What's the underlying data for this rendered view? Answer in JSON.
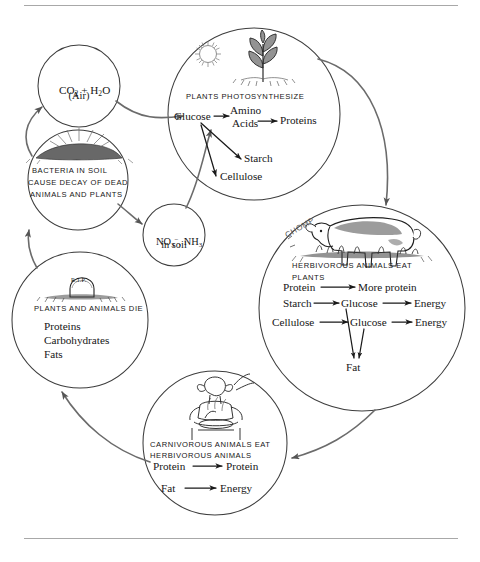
{
  "figure": {
    "domain_label": "carbon-nitrogen-cycle-diagram",
    "background_color": "#ffffff",
    "line_color": "#4a4a4a",
    "text_color": "#161616",
    "rule_color": "#a8a8a8"
  },
  "nodes": {
    "air": {
      "id": "air-circle",
      "line1_pre": "CO",
      "line1_sub": "2",
      "line1_mid": " + H",
      "line1_sub2": "2",
      "line1_post": "O",
      "line2": "(Air)",
      "cx": 79,
      "cy": 86,
      "r": 41
    },
    "bacteria": {
      "id": "bacteria-circle",
      "caption_line1": "BACTERIA IN SOIL",
      "caption_line2": "CAUSE DECAY OF DEAD",
      "caption_line3": "ANIMALS AND PLANTS",
      "icon": "soil-mound-icon",
      "cx": 78,
      "cy": 180,
      "r": 50
    },
    "soil_nutrients": {
      "id": "soil-nutrients-circle",
      "line1_pre": "NO",
      "line1_sub": "3",
      "line1_sup": "−",
      "line1_post": ", NH",
      "line1_sub2": "3",
      "line2": "in soil",
      "cx": 174,
      "cy": 235,
      "r": 31
    },
    "plants": {
      "id": "plants-photosynthesize-circle",
      "caption": "PLANTS PHOTOSYNTHESIZE",
      "icons": [
        "sun-icon",
        "plant-seedling-icon"
      ],
      "cx": 254,
      "cy": 114,
      "r": 86,
      "reactions": {
        "glucose": "Glucose",
        "amino_line1": "Amino",
        "amino_line2": "Acids",
        "proteins": "Proteins",
        "starch": "Starch",
        "cellulose": "Cellulose"
      }
    },
    "herbivores": {
      "id": "herbivorous-animals-circle",
      "caption_line1": "HERBIVOROUS ANIMALS EAT",
      "caption_line2": "PLANTS",
      "icon": "grazing-cow-icon",
      "sound_effect": "CHOMP",
      "cx": 362,
      "cy": 308,
      "r": 103,
      "reactions": {
        "protein": "Protein",
        "more_protein": "More protein",
        "starch": "Starch",
        "glucose_1": "Glucose",
        "energy_1": "Energy",
        "cellulose": "Cellulose",
        "glucose_2": "Glucose",
        "energy_2": "Energy",
        "fat": "Fat"
      }
    },
    "death": {
      "id": "plants-animals-die-circle",
      "caption": "PLANTS AND ANIMALS DIE",
      "icon": "gravestone-rip-icon",
      "icon_text": "R.I.P.",
      "cx": 80,
      "cy": 320,
      "r": 68,
      "items": [
        "Proteins",
        "Carbohydrates",
        "Fats"
      ]
    },
    "carnivores": {
      "id": "carnivorous-animals-circle",
      "caption_line1": "CARNIVOROUS ANIMALS EAT",
      "caption_line2": "HERBIVOROUS ANIMALS",
      "icon": "person-eating-icon",
      "cx": 215,
      "cy": 443,
      "r": 72,
      "reactions": {
        "protein_in": "Protein",
        "protein_out": "Protein",
        "fat_in": "Fat",
        "energy_out": "Energy"
      }
    }
  },
  "connectors": [
    {
      "name": "air-to-plants",
      "from": "air",
      "to": "plants",
      "label": ""
    },
    {
      "name": "plants-to-herbivores",
      "from": "plants",
      "to": "herbivores",
      "label": ""
    },
    {
      "name": "herbivores-to-carnivores",
      "from": "herbivores",
      "to": "carnivores",
      "label": ""
    },
    {
      "name": "carnivores-to-death",
      "from": "carnivores",
      "to": "death",
      "label": ""
    },
    {
      "name": "death-to-bacteria",
      "from": "death",
      "to": "bacteria",
      "label": ""
    },
    {
      "name": "bacteria-to-air",
      "from": "bacteria",
      "to": "air",
      "label": ""
    },
    {
      "name": "bacteria-to-soil-nutrients",
      "from": "bacteria",
      "to": "soil_nutrients",
      "label": ""
    },
    {
      "name": "soil-nutrients-to-plants",
      "from": "soil_nutrients",
      "to": "plants",
      "label": ""
    }
  ]
}
